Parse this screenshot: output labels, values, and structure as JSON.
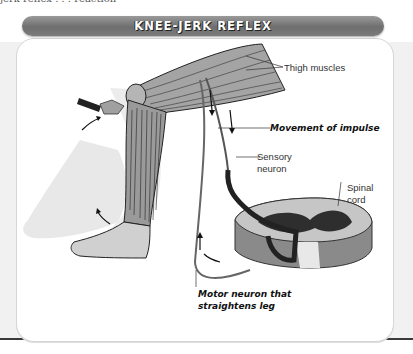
{
  "header": {
    "cut_off_text": "jerk reflex . . .   reaction"
  },
  "diagram": {
    "title": "KNEE-JERK REFLEX",
    "labels": {
      "thigh_muscles": "Thigh muscles",
      "movement_of_impulse": "Movement of impulse",
      "sensory_neuron_line1": "Sensory",
      "sensory_neuron_line2": "neuron",
      "spinal_cord_line1": "Spinal",
      "spinal_cord_line2": "cord",
      "motor_neuron_line1": "Motor neuron that",
      "motor_neuron_line2": "straightens leg"
    },
    "icons": [
      "reflex-hammer-icon",
      "motion-arrow-icon"
    ],
    "colors": {
      "title_bar": "#7a7a7a",
      "muscle_fill": "#9c9c9c",
      "ghost_leg": "#e6e6e6",
      "cord_dark": "#2e2e2e",
      "cord_light": "#c8c8c8"
    }
  }
}
